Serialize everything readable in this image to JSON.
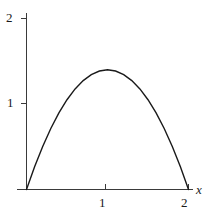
{
  "figure": {
    "background_color": "#ffffff",
    "line_color": "#1a1a1a",
    "axis_color": "#3a3a3a"
  },
  "axes": {
    "x_axis_name": "x",
    "y_axis_name": "",
    "x_ticks": [
      {
        "value": 1,
        "label": "1"
      },
      {
        "value": 2,
        "label": "2"
      }
    ],
    "y_ticks": [
      {
        "value": 1,
        "label": "1"
      },
      {
        "value": 2,
        "label": "2"
      }
    ]
  },
  "chart_data": {
    "type": "line",
    "title": "",
    "subtitle": "",
    "xlabel": "x",
    "ylabel": "",
    "xlim": [
      -0.1,
      2.25
    ],
    "ylim": [
      0,
      2.2
    ],
    "grid": false,
    "legend": false,
    "legend_position": "none",
    "annotations": [],
    "series": [
      {
        "name": "parabola",
        "description": "downward parabola with roots at x=0 and x=2, vertex at x=1",
        "x": [
          0,
          0.1,
          0.2,
          0.3,
          0.4,
          0.5,
          0.6,
          0.7,
          0.8,
          0.9,
          1.0,
          1.1,
          1.2,
          1.3,
          1.4,
          1.5,
          1.6,
          1.7,
          1.8,
          1.9,
          2.0
        ],
        "values": [
          0,
          0.266,
          0.504,
          0.714,
          0.896,
          1.05,
          1.176,
          1.274,
          1.344,
          1.386,
          1.4,
          1.386,
          1.344,
          1.274,
          1.176,
          1.05,
          0.896,
          0.714,
          0.504,
          0.266,
          0
        ]
      }
    ],
    "peak": {
      "x": 1,
      "y": 1.4
    },
    "roots": [
      0,
      2
    ]
  }
}
